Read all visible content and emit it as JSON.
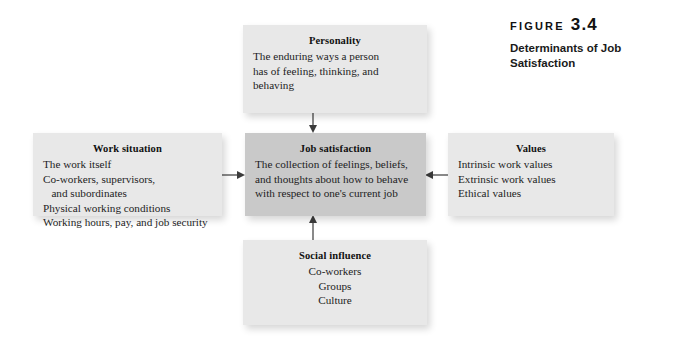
{
  "figure": {
    "label": "FIGURE",
    "number": "3.4",
    "title_line_1": "Determinants of Job",
    "title_line_2": "Satisfaction"
  },
  "colors": {
    "background": "#ffffff",
    "box_fill": "#e8e8e8",
    "center_box_fill": "#c9c9c9",
    "text": "#1b1b1b",
    "connector": "#4a4a4a"
  },
  "diagram": {
    "type": "hub-and-spoke",
    "hub": "job-satisfaction",
    "boxes": [
      {
        "id": "personality",
        "title": "Personality",
        "align": "left",
        "lines": [
          "The enduring ways a person",
          "has of feeling, thinking, and",
          "behaving"
        ]
      },
      {
        "id": "work-situation",
        "title": "Work situation",
        "align": "left",
        "lines": [
          "The work itself",
          "Co-workers, supervisors,",
          "   and subordinates",
          "Physical working conditions",
          "Working hours, pay, and job security"
        ]
      },
      {
        "id": "job-satisfaction",
        "title": "Job satisfaction",
        "align": "left",
        "lines": [
          "The collection of feelings, beliefs,",
          "and thoughts about how to behave",
          "with respect to one's current job"
        ]
      },
      {
        "id": "values",
        "title": "Values",
        "align": "left",
        "lines": [
          "Intrinsic work values",
          "Extrinsic work values",
          "Ethical values"
        ]
      },
      {
        "id": "social-influence",
        "title": "Social influence",
        "align": "center",
        "lines": [
          "Co-workers",
          "Groups",
          "Culture"
        ]
      }
    ],
    "connectors": [
      {
        "id": "personality-to-job-satisfaction",
        "from": "personality",
        "to": "job-satisfaction",
        "direction": "down"
      },
      {
        "id": "work-situation-to-job-satisfaction",
        "from": "work-situation",
        "to": "job-satisfaction",
        "direction": "right"
      },
      {
        "id": "values-to-job-satisfaction",
        "from": "values",
        "to": "job-satisfaction",
        "direction": "left"
      },
      {
        "id": "social-influence-to-job-satisfaction",
        "from": "social-influence",
        "to": "job-satisfaction",
        "direction": "up"
      }
    ]
  }
}
